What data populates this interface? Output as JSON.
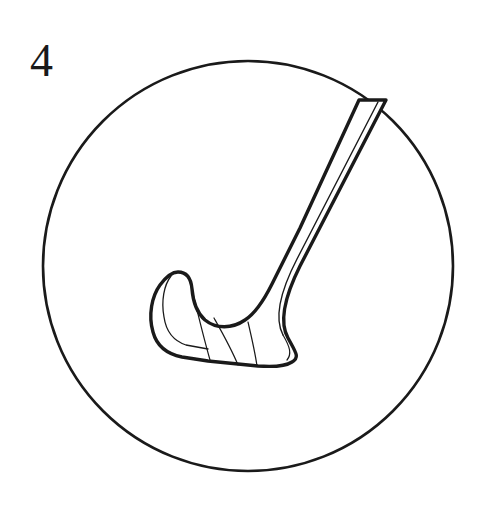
{
  "page": {
    "background_color": "#ffffff",
    "width": 486,
    "height": 506
  },
  "label": {
    "page_number": "4",
    "color": "#1a1a1a"
  },
  "artwork": {
    "name": "hockey-stick-in-circle",
    "description": "Line drawing of an ice hockey stick inside a circular frame",
    "line_color": "#1a1a1a",
    "fill_color": "#ffffff",
    "circle": {
      "center_x": 248,
      "center_y": 266,
      "radius": 205,
      "stroke_width": 2.6
    },
    "stick": {
      "shaft_stroke_width": 3.2,
      "blade_stroke_width": 3.4,
      "detail_stroke_width": 1.2,
      "toe_tip_x": 175,
      "toe_tip_y": 272,
      "shaft_top_x": 386,
      "shaft_top_y": 100,
      "blade_stripe_count": 3
    }
  }
}
